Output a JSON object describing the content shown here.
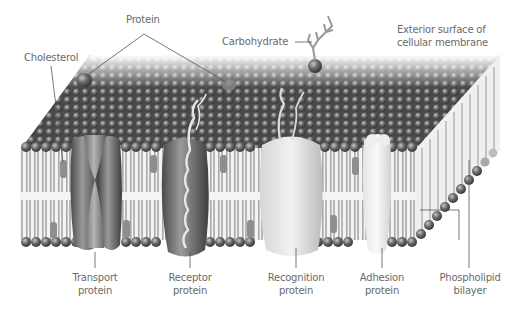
{
  "diagram": {
    "colors": {
      "head_dark": "#3a3a3a",
      "head_light": "#9a9a9a",
      "tail": "#b8b8b8",
      "label_text": "#6a6a6a",
      "leader_line": "#444444"
    },
    "labels": {
      "protein": "Protein",
      "cholesterol": "Cholesterol",
      "carbohydrate": "Carbohydrate",
      "exterior_line1": "Exterior surface of",
      "exterior_line2": "cellular membrane",
      "transport_line1": "Transport",
      "transport_line2": "protein",
      "receptor_line1": "Receptor",
      "receptor_line2": "protein",
      "recognition_line1": "Recognition",
      "recognition_line2": "protein",
      "adhesion_line1": "Adhesion",
      "adhesion_line2": "protein",
      "phospholipid_line1": "Phospholipid",
      "phospholipid_line2": "bilayer"
    }
  }
}
